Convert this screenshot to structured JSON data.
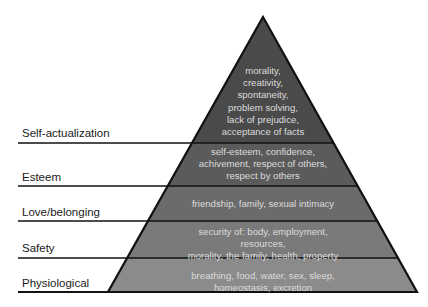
{
  "diagram": {
    "type": "pyramid",
    "levels": [
      {
        "label": "Self-actualization",
        "description": "morality,\ncreativity,\nspontaneity,\nproblem solving,\nlack of prejudice,\nacceptance of facts",
        "fill": "#4a4a4a"
      },
      {
        "label": "Esteem",
        "description": "self-esteem, confidence,\nachivement, respect of others,\nrespect by others",
        "fill": "#5b5b5b"
      },
      {
        "label": "Love/belonging",
        "description": "friendship, family, sexual intimacy",
        "fill": "#6b6b6b"
      },
      {
        "label": "Safety",
        "description": "security of: body, employment, resources,\nmorality, the family, health, property",
        "fill": "#7a7a7a"
      },
      {
        "label": "Physiological",
        "description": "breathing, food, water, sex, sleep, homeostasis, excretion",
        "fill": "#8b8b8b"
      }
    ],
    "colors": {
      "outline": "#111111",
      "text_on_tier": "#dcdcdc",
      "label_text": "#1a1a1a",
      "background": "#ffffff"
    }
  }
}
